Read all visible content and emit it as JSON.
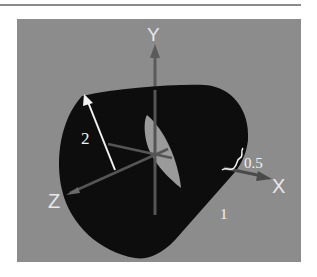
{
  "figure": {
    "type": "3d-cone-frustum-diagram",
    "colors": {
      "background": "#ffffff",
      "panel": "#8c8c8c",
      "rule": "#8a8a8a",
      "cone_body": "#0d0d0d",
      "inner_opening": "#9a9a9a",
      "axis": "#555555",
      "label": "#f2f2f2"
    },
    "axes": {
      "x_label": "X",
      "y_label": "Y",
      "z_label": "Z"
    },
    "annotations": {
      "large_radius": "2",
      "small_radius": "0.5",
      "length": "1"
    }
  }
}
